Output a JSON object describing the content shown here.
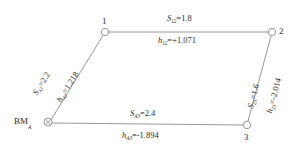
{
  "diagram": {
    "type": "leveling-network",
    "title": "",
    "nodes": [
      {
        "id": "bm",
        "label": "BM",
        "subscript": "A",
        "marker": "benchmark-crossed-circle",
        "x": 48,
        "y": 122
      },
      {
        "id": "n1",
        "label": "1",
        "marker": "open-circle",
        "x": 105,
        "y": 32
      },
      {
        "id": "n2",
        "label": "2",
        "marker": "open-circle",
        "x": 272,
        "y": 32
      },
      {
        "id": "n3",
        "label": "3",
        "marker": "open-circle",
        "x": 247,
        "y": 125
      }
    ],
    "edges": [
      {
        "id": "bm-1",
        "from": "bm",
        "to": "n1",
        "distance_symbol": "S",
        "distance_subscript": "A1",
        "distance_value": "2.2",
        "height_symbol": "h",
        "height_subscript": "A1",
        "height_value": "1.218"
      },
      {
        "id": "1-2",
        "from": "n1",
        "to": "n2",
        "distance_symbol": "S",
        "distance_subscript": "12",
        "distance_value": "1.8",
        "height_symbol": "h",
        "height_subscript": "12",
        "height_value": "+1.071"
      },
      {
        "id": "2-3",
        "from": "n2",
        "to": "n3",
        "distance_symbol": "S",
        "distance_subscript": "23",
        "distance_value": "1.6",
        "height_symbol": "h",
        "height_subscript": "23",
        "height_value": "-2.014"
      },
      {
        "id": "bm-3",
        "from": "bm",
        "to": "n3",
        "distance_symbol": "S",
        "distance_subscript": "A3",
        "distance_value": "2.4",
        "height_symbol": "h",
        "height_subscript": "A3",
        "height_value": "-1.894"
      }
    ],
    "labels": {
      "s_a1": "=2.2",
      "h_a1": "=1.218",
      "s_12": "=1.8",
      "h_12": "=+1.071",
      "s_23": "=1.6",
      "h_23": "=-2.014",
      "s_a3": "=2.4",
      "h_a3": "=-1.894",
      "sym_s": "S",
      "sym_h": "h",
      "sub_a1": "A1",
      "sub_12": "12",
      "sub_23": "23",
      "sub_a3": "A3",
      "node1": "1",
      "node2": "2",
      "node3": "3",
      "bm": "BM",
      "bm_sub": "A"
    },
    "colors": {
      "line": "#8c8c8c",
      "text": "#2b2b2b",
      "background": "#ffffff",
      "node_fill": "#ffffff"
    }
  }
}
